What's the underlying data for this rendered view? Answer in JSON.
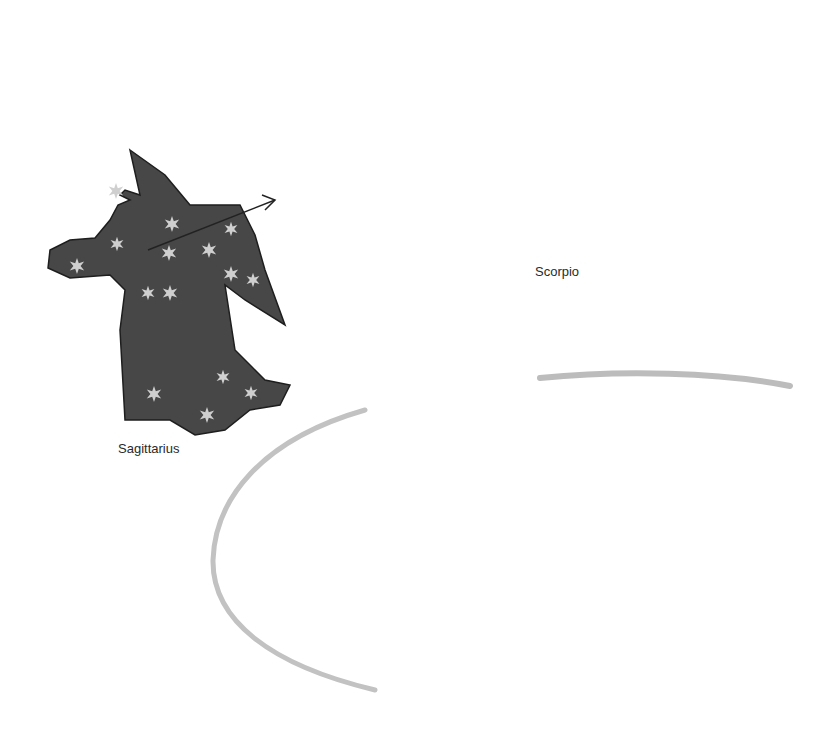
{
  "illustration": {
    "labels": {
      "sagittarius": "Sagittarius",
      "scorpio": "Scorpio"
    },
    "colors": {
      "constellation_fill": "#4a4a4a",
      "star_fill": "#c8c8c8",
      "sun_fill": "#9a9a9a",
      "planet_fill": "#555555",
      "orbit_stroke": "#bdbdbd"
    }
  }
}
